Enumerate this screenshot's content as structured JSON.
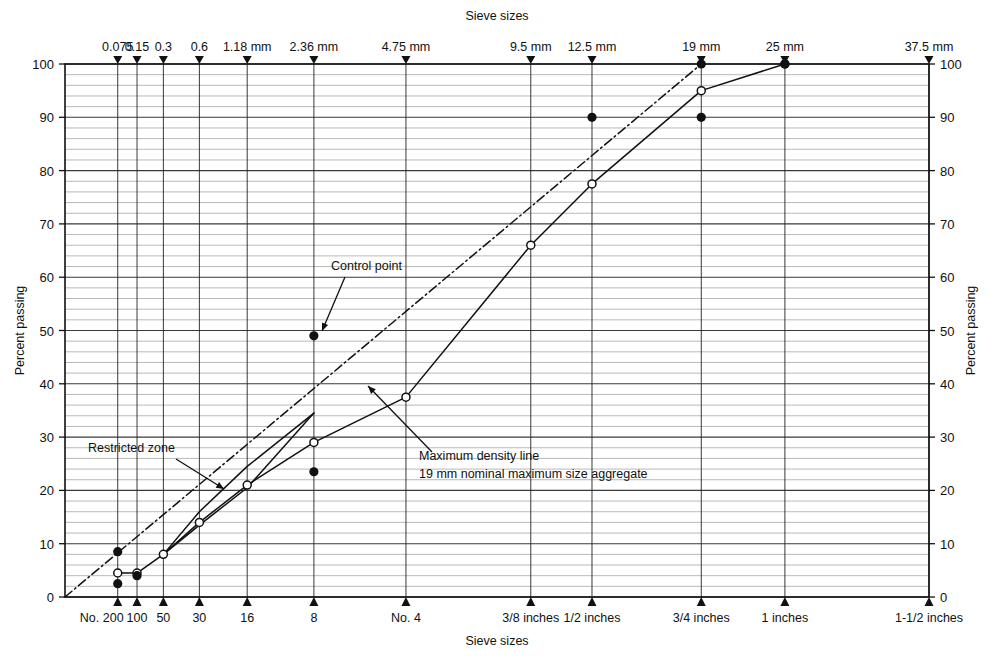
{
  "chart_data": {
    "type": "line",
    "title": "",
    "xlabel": "Sieve sizes",
    "ylabel": "Percent passing",
    "xlabel_top": "Sieve sizes",
    "ylabel_right": "Percent passing",
    "ylim": [
      0,
      100
    ],
    "y_ticks": [
      0,
      10,
      20,
      30,
      40,
      50,
      60,
      70,
      80,
      90,
      100
    ],
    "y_minor_step": 2,
    "grid": true,
    "legend_position": "none",
    "x_scale": "0.45-power",
    "x_axis_top_ticks": [
      {
        "label": "0.075",
        "mm": 0.075
      },
      {
        "label": "0.15",
        "mm": 0.15
      },
      {
        "label": "0.3",
        "mm": 0.3
      },
      {
        "label": "0.6",
        "mm": 0.6
      },
      {
        "label": "1.18 mm",
        "mm": 1.18
      },
      {
        "label": "2.36 mm",
        "mm": 2.36
      },
      {
        "label": "4.75 mm",
        "mm": 4.75
      },
      {
        "label": "9.5 mm",
        "mm": 9.5
      },
      {
        "label": "12.5 mm",
        "mm": 12.5
      },
      {
        "label": "19 mm",
        "mm": 19
      },
      {
        "label": "25 mm",
        "mm": 25
      },
      {
        "label": "37.5 mm",
        "mm": 37.5
      }
    ],
    "x_axis_bottom_ticks": [
      {
        "label": "No. 200",
        "mm": 0.075
      },
      {
        "label": "100",
        "mm": 0.15
      },
      {
        "label": "50",
        "mm": 0.3
      },
      {
        "label": "30",
        "mm": 0.6
      },
      {
        "label": "16",
        "mm": 1.18
      },
      {
        "label": "8",
        "mm": 2.36
      },
      {
        "label": "No. 4",
        "mm": 4.75
      },
      {
        "label": "3/8 inches",
        "mm": 9.5
      },
      {
        "label": "1/2 inches",
        "mm": 12.5
      },
      {
        "label": "3/4 inches",
        "mm": 19
      },
      {
        "label": "1 inches",
        "mm": 25
      },
      {
        "label": "1-1/2 inches",
        "mm": 37.5
      }
    ],
    "series": [
      {
        "name": "Maximum density line",
        "style": "dash-dot",
        "marker": "none",
        "points": [
          [
            0.0,
            0
          ],
          [
            19,
            100
          ]
        ]
      },
      {
        "name": "Gradation curve",
        "style": "solid",
        "marker": "open-circle",
        "points": [
          [
            0.075,
            4.5
          ],
          [
            0.15,
            4.5
          ],
          [
            0.3,
            8.0
          ],
          [
            0.6,
            14.0
          ],
          [
            1.18,
            21.0
          ],
          [
            2.36,
            29.0
          ],
          [
            4.75,
            37.5
          ],
          [
            9.5,
            66.0
          ],
          [
            12.5,
            77.5
          ],
          [
            19,
            95.0
          ],
          [
            25,
            100.0
          ]
        ]
      },
      {
        "name": "Restricted zone lower boundary",
        "style": "solid",
        "marker": "none",
        "points": [
          [
            0.3,
            8.0
          ],
          [
            0.6,
            13.5
          ],
          [
            1.18,
            20.5
          ],
          [
            2.36,
            34.5
          ]
        ]
      },
      {
        "name": "Restricted zone upper boundary",
        "style": "solid",
        "marker": "none",
        "points": [
          [
            0.3,
            8.0
          ],
          [
            0.6,
            16.0
          ],
          [
            1.18,
            24.5
          ],
          [
            2.36,
            34.5
          ]
        ]
      }
    ],
    "control_points": [
      {
        "mm": 0.075,
        "value": 8.5
      },
      {
        "mm": 0.075,
        "value": 2.5
      },
      {
        "mm": 0.15,
        "value": 4.0
      },
      {
        "mm": 2.36,
        "value": 49.0
      },
      {
        "mm": 2.36,
        "value": 23.5
      },
      {
        "mm": 12.5,
        "value": 90.0
      },
      {
        "mm": 19,
        "value": 90.0
      },
      {
        "mm": 19,
        "value": 100.0
      },
      {
        "mm": 25,
        "value": 100.0
      }
    ],
    "annotations": [
      {
        "text": "Control point",
        "target_mm": 2.36,
        "target_value": 49.0
      },
      {
        "text": "Restricted zone",
        "target_mm": 0.85,
        "target_value": 25.5
      },
      {
        "text": "Maximum density line",
        "target_mm": 2.8,
        "target_value": 39.5
      },
      {
        "text": "19 mm nominal maximum size aggregate",
        "target_mm": 2.8,
        "target_value": 39.5
      }
    ]
  },
  "labels": {
    "top_axis_title": "Sieve sizes",
    "bottom_axis_title": "Sieve sizes",
    "left_axis_title": "Percent passing",
    "right_axis_title": "Percent passing",
    "anno_control_point": "Control point",
    "anno_restricted_zone": "Restricted zone",
    "anno_max_density_line": "Maximum density line",
    "anno_nominal_size": "19 mm nominal maximum size aggregate"
  },
  "colors": {
    "ink": "#111111",
    "grid_minor": "#8a8a8a",
    "grid_major": "#3a3a3a",
    "background": "#ffffff"
  }
}
